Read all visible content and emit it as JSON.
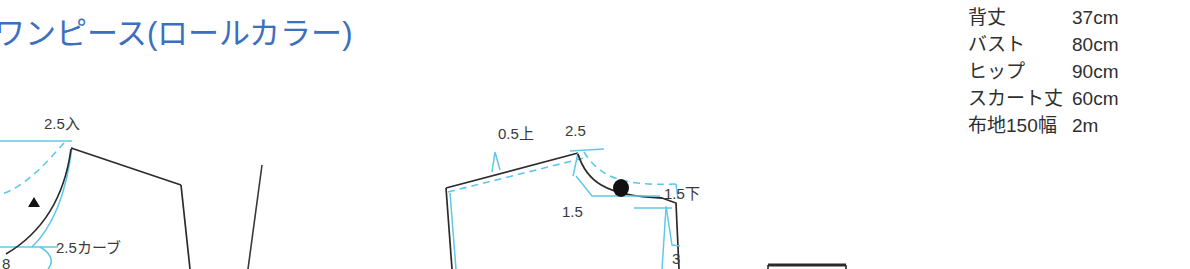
{
  "page": {
    "title": "ワンピース(ロールカラー)",
    "title_color": "#3d6fbf",
    "background": "#ffffff"
  },
  "spec_table": {
    "rows": [
      {
        "label": "背丈",
        "value": "37cm"
      },
      {
        "label": "バスト",
        "value": "80cm"
      },
      {
        "label": "ヒップ",
        "value": "90cm"
      },
      {
        "label": "スカート丈",
        "value": "60cm"
      },
      {
        "label": "布地150幅",
        "value": "2m"
      }
    ]
  },
  "pattern": {
    "ink_color": "#333333",
    "guide_color": "#5ec8e8",
    "annotations": {
      "left_in": "2.5入",
      "left_curve": "2.5カーブ",
      "left_eight": "8",
      "right_up": "0.5上",
      "right_two_five": "2.5",
      "right_one_five": "1.5",
      "right_one_five_down": "1.5下",
      "right_three": "3"
    }
  }
}
